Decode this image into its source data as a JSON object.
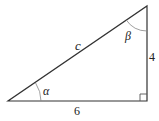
{
  "diagram": {
    "type": "right-triangle",
    "labels": {
      "hypotenuse": "c",
      "vertical_leg": "4",
      "horizontal_leg": "6",
      "angle_bottom_left": "α",
      "angle_top": "β"
    },
    "colors": {
      "stroke": "#333333",
      "arc": "#888888",
      "text": "#222222"
    }
  }
}
